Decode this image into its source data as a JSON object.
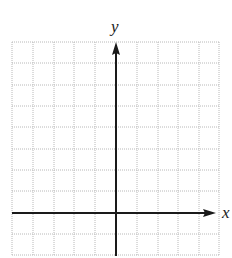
{
  "diagram": {
    "type": "coordinate-grid",
    "x_axis_label": "x",
    "y_axis_label": "y",
    "grid": {
      "columns": 10,
      "rows": 10,
      "x_axis_row_from_top": 8,
      "y_axis_col_from_left": 5
    },
    "colors": {
      "grid": "#b8b8b8",
      "axis": "#1a1a1a",
      "background": "#ffffff"
    }
  }
}
